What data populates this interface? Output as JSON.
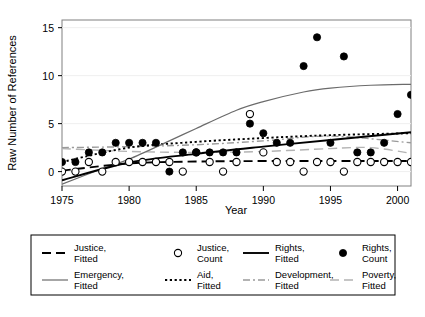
{
  "chart_data": {
    "type": "scatter",
    "title": "",
    "xlabel": "Year",
    "ylabel": "Raw Number of References",
    "xlim": [
      1975,
      2001
    ],
    "ylim": [
      -1.5,
      15.8
    ],
    "xticks": [
      1975,
      1980,
      1985,
      1990,
      1995,
      2000
    ],
    "yticks": [
      0,
      5,
      10,
      15
    ],
    "grid": "horizontal-light",
    "legend_position": "below-plot",
    "series": [
      {
        "name": "Rights, Count",
        "type": "scatter",
        "marker": "filled-circle",
        "x": [
          1975,
          1976,
          1977,
          1978,
          1979,
          1980,
          1981,
          1982,
          1983,
          1984,
          1985,
          1986,
          1987,
          1988,
          1989,
          1990,
          1991,
          1992,
          1993,
          1994,
          1995,
          1996,
          1997,
          1998,
          1999,
          2000,
          2001
        ],
        "y": [
          1,
          1,
          2,
          2,
          3,
          3,
          3,
          3,
          0,
          2,
          2,
          2,
          2,
          2,
          5,
          4,
          3,
          3,
          11,
          14,
          3,
          12,
          2,
          2,
          3,
          6,
          8
        ]
      },
      {
        "name": "Justice, Count",
        "type": "scatter",
        "marker": "open-circle",
        "x": [
          1975,
          1976,
          1977,
          1978,
          1979,
          1980,
          1981,
          1982,
          1983,
          1984,
          1985,
          1986,
          1987,
          1988,
          1989,
          1990,
          1991,
          1992,
          1993,
          1994,
          1995,
          1996,
          1997,
          1998,
          1999,
          2000,
          2001
        ],
        "y": [
          0,
          0,
          1,
          0,
          1,
          1,
          1,
          1,
          1,
          0,
          2,
          1,
          0,
          1,
          6,
          2,
          1,
          1,
          0,
          1,
          1,
          0,
          1,
          1,
          1,
          1,
          1
        ]
      },
      {
        "name": "Justice, Fitted",
        "type": "line",
        "style": "dashed",
        "x": [
          1975,
          1980,
          1985,
          1990,
          1995,
          2001
        ],
        "y": [
          0.1,
          0.85,
          1.05,
          1.1,
          1.1,
          1.1
        ]
      },
      {
        "name": "Rights, Fitted",
        "type": "line",
        "style": "solid-thick",
        "x": [
          1975,
          1980,
          1985,
          1990,
          1995,
          2001
        ],
        "y": [
          -0.9,
          0.95,
          1.85,
          2.6,
          3.3,
          4.1
        ]
      },
      {
        "name": "Emergency, Fitted",
        "type": "line",
        "style": "solid-thin",
        "x": [
          1975,
          1978,
          1980,
          1983,
          1985,
          1988,
          1990,
          1993,
          1995,
          1998,
          2001
        ],
        "y": [
          -1.3,
          0.3,
          1.3,
          3.2,
          4.5,
          6.4,
          7.3,
          8.3,
          8.7,
          9.0,
          9.1
        ]
      },
      {
        "name": "Aid, Fitted",
        "type": "line",
        "style": "dotted",
        "x": [
          1975,
          1980,
          1985,
          1990,
          1995,
          2001
        ],
        "y": [
          1.0,
          2.5,
          3.1,
          3.5,
          3.8,
          4.0
        ]
      },
      {
        "name": "Development, Fitted",
        "type": "line",
        "style": "dash-dot",
        "x": [
          1975,
          1980,
          1985,
          1990,
          1995,
          2001
        ],
        "y": [
          2.5,
          2.6,
          2.8,
          3.2,
          3.7,
          3.0
        ]
      },
      {
        "name": "Poverty, Fitted",
        "type": "line",
        "style": "long-dash-light",
        "x": [
          1975,
          1980,
          1985,
          1990,
          1995,
          1998,
          2001
        ],
        "y": [
          2.4,
          2.1,
          2.0,
          2.1,
          2.4,
          2.5,
          1.9
        ]
      }
    ]
  },
  "axes": {
    "ylabel": "Raw Number of References",
    "xlabel": "Year",
    "xtick_labels": [
      "1975",
      "1980",
      "1985",
      "1990",
      "1995",
      "2000"
    ],
    "ytick_labels": [
      "0",
      "5",
      "10",
      "15"
    ]
  },
  "legend": {
    "entries": [
      {
        "label_line1": "Justice,",
        "label_line2": "Fitted",
        "key": "dashed"
      },
      {
        "label_line1": "Justice,",
        "label_line2": "Count",
        "key": "open-circle"
      },
      {
        "label_line1": "Rights,",
        "label_line2": "Fitted",
        "key": "solid-thick"
      },
      {
        "label_line1": "Rights,",
        "label_line2": "Count",
        "key": "filled-circle"
      },
      {
        "label_line1": "Emergency,",
        "label_line2": "Fitted",
        "key": "solid-thin"
      },
      {
        "label_line1": "Aid,",
        "label_line2": "Fitted",
        "key": "dotted"
      },
      {
        "label_line1": "Development,",
        "label_line2": "Fitted",
        "key": "dash-dot"
      },
      {
        "label_line1": "Poverty,",
        "label_line2": "Fitted",
        "key": "long-dash-light"
      }
    ]
  },
  "colors": {
    "foreground": "#000000",
    "frame": "#808080",
    "grid": "#efefef",
    "light_line": "#9a9a9a",
    "background": "#ffffff"
  }
}
